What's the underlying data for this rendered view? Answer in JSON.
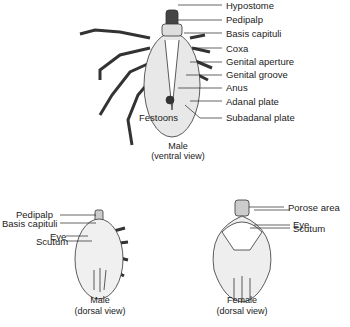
{
  "figures": {
    "male_ventral": {
      "caption_line1": "Male",
      "caption_line2": "(ventral view)",
      "labels": [
        "Hypostome",
        "Pedipalp",
        "Basis capituli",
        "Coxa",
        "Genital aperture",
        "Genital groove",
        "Anus",
        "Adanal plate",
        "Subadanal plate"
      ],
      "left_label": "Festoons"
    },
    "male_dorsal": {
      "caption_line1": "Male",
      "caption_line2": "(dorsal view)",
      "labels": [
        "Pedipalp",
        "Basis capituli",
        "Eye",
        "Scutum"
      ]
    },
    "female_dorsal": {
      "caption_line1": "Female",
      "caption_line2": "(dorsal view)",
      "labels": [
        "Porose area",
        "Eye",
        "Scutum"
      ]
    }
  }
}
